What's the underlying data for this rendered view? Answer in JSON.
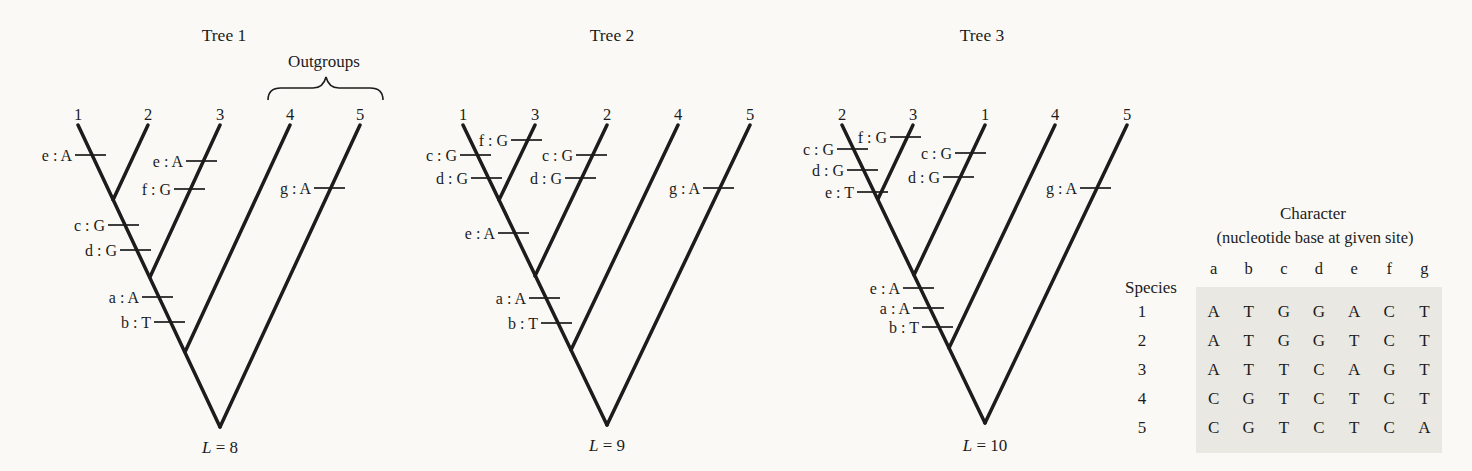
{
  "palette": {
    "background": "#faf9f6",
    "ink": "#1c1c1c",
    "table_background": "#e9e8e3"
  },
  "outgroups": {
    "label": "Outgroups",
    "brace": {
      "x1": 268,
      "x2": 383,
      "cusp_x": 326,
      "y_end": 100,
      "y_shoulder": 88,
      "y_cusp": 77
    }
  },
  "trees": [
    {
      "title": "Tree 1",
      "tip_y": 125,
      "tips": [
        {
          "label": "1",
          "x": 78
        },
        {
          "label": "2",
          "x": 148
        },
        {
          "label": "3",
          "x": 220
        },
        {
          "label": "4",
          "x": 290
        },
        {
          "label": "5",
          "x": 360
        }
      ],
      "segments": [
        [
          78,
          125,
          220,
          427
        ],
        [
          360,
          125,
          220,
          427
        ],
        [
          148,
          125,
          113,
          200
        ],
        [
          220,
          125,
          150,
          277
        ],
        [
          290,
          125,
          185,
          352
        ]
      ],
      "ticks": [
        {
          "label": "e : A",
          "x": 92,
          "y": 155
        },
        {
          "label": "e : A",
          "x": 203,
          "y": 161
        },
        {
          "label": "f : G",
          "x": 191,
          "y": 189
        },
        {
          "label": "c : G",
          "x": 125,
          "y": 225
        },
        {
          "label": "d : G",
          "x": 137,
          "y": 250
        },
        {
          "label": "a : A",
          "x": 159,
          "y": 297
        },
        {
          "label": "b : T",
          "x": 171,
          "y": 322
        },
        {
          "label": "g : A",
          "x": 331,
          "y": 188
        }
      ],
      "length": {
        "var": "L",
        "rest": " = 8"
      }
    },
    {
      "title": "Tree 2",
      "tip_y": 125,
      "tips": [
        {
          "label": "1",
          "x": 463
        },
        {
          "label": "3",
          "x": 535
        },
        {
          "label": "2",
          "x": 607
        },
        {
          "label": "4",
          "x": 678
        },
        {
          "label": "5",
          "x": 750
        }
      ],
      "segments": [
        [
          463,
          125,
          607,
          425
        ],
        [
          750,
          125,
          607,
          425
        ],
        [
          535,
          125,
          499,
          200
        ],
        [
          607,
          125,
          535,
          276
        ],
        [
          678,
          125,
          571,
          350
        ]
      ],
      "ticks": [
        {
          "label": "f : G",
          "x": 528,
          "y": 140
        },
        {
          "label": "c : G",
          "x": 477,
          "y": 155
        },
        {
          "label": "d : G",
          "x": 488,
          "y": 178
        },
        {
          "label": "c : G",
          "x": 593,
          "y": 155
        },
        {
          "label": "d : G",
          "x": 582,
          "y": 178
        },
        {
          "label": "e : A",
          "x": 515,
          "y": 233
        },
        {
          "label": "a : A",
          "x": 546,
          "y": 298
        },
        {
          "label": "b : T",
          "x": 558,
          "y": 323
        },
        {
          "label": "g : A",
          "x": 720,
          "y": 188
        }
      ],
      "length": {
        "var": "L",
        "rest": " = 9"
      }
    },
    {
      "title": "Tree 3",
      "tip_y": 125,
      "tips": [
        {
          "label": "2",
          "x": 842
        },
        {
          "label": "3",
          "x": 913
        },
        {
          "label": "1",
          "x": 985
        },
        {
          "label": "4",
          "x": 1055
        },
        {
          "label": "5",
          "x": 1127
        }
      ],
      "segments": [
        [
          842,
          125,
          985,
          423
        ],
        [
          1127,
          125,
          985,
          423
        ],
        [
          913,
          125,
          878,
          199
        ],
        [
          985,
          125,
          914,
          275
        ],
        [
          1055,
          125,
          949,
          348
        ]
      ],
      "ticks": [
        {
          "label": "f : G",
          "x": 907,
          "y": 137
        },
        {
          "label": "c : G",
          "x": 854,
          "y": 149
        },
        {
          "label": "d : G",
          "x": 864,
          "y": 170
        },
        {
          "label": "e : T",
          "x": 874,
          "y": 192
        },
        {
          "label": "c : G",
          "x": 972,
          "y": 153
        },
        {
          "label": "d : G",
          "x": 960,
          "y": 177
        },
        {
          "label": "e : A",
          "x": 920,
          "y": 288
        },
        {
          "label": "a : A",
          "x": 930,
          "y": 308
        },
        {
          "label": "b : T",
          "x": 939,
          "y": 327
        },
        {
          "label": "g : A",
          "x": 1097,
          "y": 188
        }
      ],
      "length": {
        "var": "L",
        "rest": " = 10"
      }
    }
  ],
  "table": {
    "title": "Character",
    "subtitle": "(nucleotide base at given site)",
    "row_header": "Species",
    "columns": [
      "a",
      "b",
      "c",
      "d",
      "e",
      "f",
      "g"
    ],
    "rows": [
      {
        "species": "1",
        "bases": [
          "A",
          "T",
          "G",
          "G",
          "A",
          "C",
          "T"
        ]
      },
      {
        "species": "2",
        "bases": [
          "A",
          "T",
          "G",
          "G",
          "T",
          "C",
          "T"
        ]
      },
      {
        "species": "3",
        "bases": [
          "A",
          "T",
          "T",
          "C",
          "A",
          "G",
          "T"
        ]
      },
      {
        "species": "4",
        "bases": [
          "C",
          "G",
          "T",
          "C",
          "T",
          "C",
          "T"
        ]
      },
      {
        "species": "5",
        "bases": [
          "C",
          "G",
          "T",
          "C",
          "T",
          "C",
          "A"
        ]
      }
    ]
  }
}
